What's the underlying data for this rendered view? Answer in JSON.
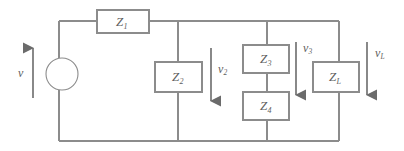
{
  "figure": {
    "name": "impedance-ladder-circuit",
    "type": "electrical-circuit-schematic",
    "colors": {
      "wire": "#8c8c8c",
      "box_stroke": "#8c8c8c",
      "box_fill": "#ffffff",
      "arrow": "#6b6b6b",
      "text": "#5e5e5e",
      "background": "#ffffff"
    },
    "source": {
      "name": "voltage-source",
      "shape": "circle",
      "center_x": 62,
      "center_y": 74,
      "radius": 16
    },
    "rails": {
      "top_y": 21,
      "bottom_y": 141,
      "left_x": 59,
      "right_x": 339
    },
    "nodes_x": [
      178,
      267,
      339
    ]
  },
  "impedances": [
    {
      "id": "Z1",
      "symbol": "Z",
      "subscript": "1",
      "orientation": "horizontal",
      "x": 97,
      "y": 10,
      "w": 52,
      "h": 23
    },
    {
      "id": "Z2",
      "symbol": "Z",
      "subscript": "2",
      "orientation": "horizontal",
      "x": 155,
      "y": 62,
      "w": 47,
      "h": 30
    },
    {
      "id": "Z3",
      "symbol": "Z",
      "subscript": "3",
      "orientation": "horizontal",
      "x": 243,
      "y": 45,
      "w": 46,
      "h": 28
    },
    {
      "id": "Z4",
      "symbol": "Z",
      "subscript": "4",
      "orientation": "horizontal",
      "x": 243,
      "y": 92,
      "w": 46,
      "h": 28
    },
    {
      "id": "ZL",
      "symbol": "Z",
      "subscript": "L",
      "orientation": "horizontal",
      "x": 313,
      "y": 62,
      "w": 46,
      "h": 30
    }
  ],
  "voltages": [
    {
      "id": "v",
      "symbol": "v",
      "subscript": "",
      "direction": "up",
      "arrow_x": 33,
      "arrow_top": 48,
      "arrow_bottom": 98,
      "label_x": 18,
      "label_y": 67
    },
    {
      "id": "v2",
      "symbol": "v",
      "subscript": "2",
      "direction": "down",
      "arrow_x": 211,
      "arrow_top": 48,
      "arrow_bottom": 101,
      "label_x": 218,
      "label_y": 63
    },
    {
      "id": "v3",
      "symbol": "v",
      "subscript": "3",
      "direction": "down",
      "arrow_x": 296,
      "arrow_top": 42,
      "arrow_bottom": 95,
      "label_x": 303,
      "label_y": 42
    },
    {
      "id": "vL",
      "symbol": "v",
      "subscript": "L",
      "direction": "down",
      "arrow_x": 367,
      "arrow_top": 42,
      "arrow_bottom": 95,
      "label_x": 375,
      "label_y": 47
    }
  ]
}
